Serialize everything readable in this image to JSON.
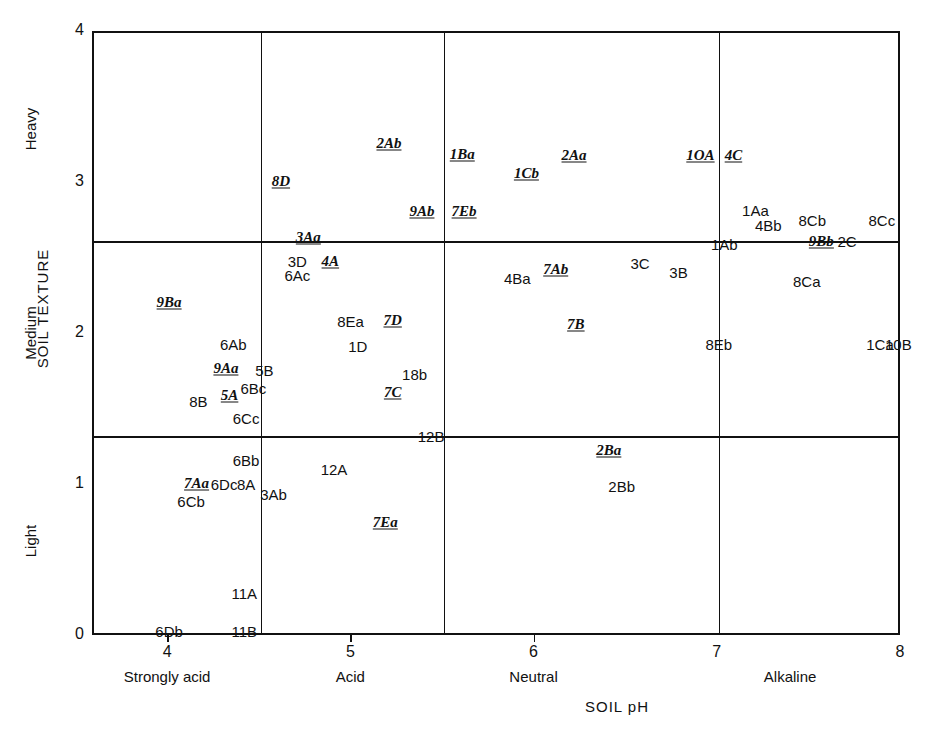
{
  "chart_data": {
    "type": "scatter",
    "title": "",
    "xlabel": "SOIL pH",
    "ylabel": "SOIL TEXTURE",
    "xlim": [
      3.59,
      8.0
    ],
    "ylim": [
      0,
      4
    ],
    "grid": true,
    "x_ticks": [
      4,
      5,
      6,
      7,
      8
    ],
    "x_tick_labels": [
      "4",
      "5",
      "6",
      "7",
      "8"
    ],
    "y_ticks": [
      0,
      1,
      2,
      3,
      4
    ],
    "y_tick_labels": [
      "0",
      "1",
      "2",
      "3",
      "4"
    ],
    "x_categories": [
      {
        "label": "Strongly acid",
        "center": 4.0
      },
      {
        "label": "Acid",
        "center": 5.0
      },
      {
        "label": "Neutral",
        "center": 6.0
      },
      {
        "label": "Alkaline",
        "center": 7.4
      }
    ],
    "y_categories": [
      {
        "label": "Light",
        "center": 0.62
      },
      {
        "label": "Medium",
        "center": 2.0
      },
      {
        "label": "Heavy",
        "center": 3.35
      }
    ],
    "x_dividers": [
      4.5,
      5.5,
      7.0
    ],
    "y_dividers": [
      1.33,
      2.62
    ],
    "points": [
      {
        "label": "8D",
        "x": 4.61,
        "y": 3.02,
        "style": "italic"
      },
      {
        "label": "2Ab",
        "x": 5.2,
        "y": 3.27,
        "style": "italic"
      },
      {
        "label": "1Ba",
        "x": 5.6,
        "y": 3.2,
        "style": "italic"
      },
      {
        "label": "1Cb",
        "x": 5.95,
        "y": 3.07,
        "style": "italic"
      },
      {
        "label": "2Aa",
        "x": 6.21,
        "y": 3.19,
        "style": "italic"
      },
      {
        "label": "1OA",
        "x": 6.9,
        "y": 3.19,
        "style": "italic"
      },
      {
        "label": "4C",
        "x": 7.08,
        "y": 3.19,
        "style": "italic"
      },
      {
        "label": "9Ab",
        "x": 5.38,
        "y": 2.82,
        "style": "italic"
      },
      {
        "label": "7Eb",
        "x": 5.61,
        "y": 2.82,
        "style": "italic"
      },
      {
        "label": "1Aa",
        "x": 7.2,
        "y": 2.83,
        "style": "plain"
      },
      {
        "label": "4Bb",
        "x": 7.27,
        "y": 2.73,
        "style": "plain"
      },
      {
        "label": "8Cb",
        "x": 7.51,
        "y": 2.76,
        "style": "plain"
      },
      {
        "label": "8Cc",
        "x": 7.89,
        "y": 2.76,
        "style": "plain"
      },
      {
        "label": "3Aa",
        "x": 4.76,
        "y": 2.65,
        "style": "italic"
      },
      {
        "label": "1Ab",
        "x": 7.03,
        "y": 2.6,
        "style": "plain"
      },
      {
        "label": "9Bb",
        "x": 7.56,
        "y": 2.62,
        "style": "italic"
      },
      {
        "label": "2C",
        "x": 7.7,
        "y": 2.62,
        "style": "plain"
      },
      {
        "label": "3D",
        "x": 4.7,
        "y": 2.49,
        "style": "plain"
      },
      {
        "label": "4A",
        "x": 4.88,
        "y": 2.49,
        "style": "italic"
      },
      {
        "label": "6Ac",
        "x": 4.7,
        "y": 2.4,
        "style": "plain"
      },
      {
        "label": "3C",
        "x": 6.57,
        "y": 2.48,
        "style": "plain"
      },
      {
        "label": "3B",
        "x": 6.78,
        "y": 2.42,
        "style": "plain"
      },
      {
        "label": "4Ba",
        "x": 5.9,
        "y": 2.38,
        "style": "plain"
      },
      {
        "label": "7Ab",
        "x": 6.11,
        "y": 2.44,
        "style": "italic"
      },
      {
        "label": "8Ca",
        "x": 7.48,
        "y": 2.36,
        "style": "plain"
      },
      {
        "label": "9Ba",
        "x": 4.0,
        "y": 2.22,
        "style": "italic"
      },
      {
        "label": "8Ea",
        "x": 4.99,
        "y": 2.09,
        "style": "plain"
      },
      {
        "label": "7D",
        "x": 5.22,
        "y": 2.1,
        "style": "italic"
      },
      {
        "label": "7B",
        "x": 6.22,
        "y": 2.07,
        "style": "italic"
      },
      {
        "label": "6Ab",
        "x": 4.35,
        "y": 1.94,
        "style": "plain"
      },
      {
        "label": "1D",
        "x": 5.03,
        "y": 1.93,
        "style": "plain"
      },
      {
        "label": "8Eb",
        "x": 7.0,
        "y": 1.94,
        "style": "plain"
      },
      {
        "label": "1Ca",
        "x": 7.88,
        "y": 1.94,
        "style": "plain"
      },
      {
        "label": "10B",
        "x": 7.98,
        "y": 1.94,
        "style": "plain"
      },
      {
        "label": "9Aa",
        "x": 4.31,
        "y": 1.78,
        "style": "italic"
      },
      {
        "label": "5B",
        "x": 4.52,
        "y": 1.77,
        "style": "plain"
      },
      {
        "label": "18b",
        "x": 5.34,
        "y": 1.74,
        "style": "plain"
      },
      {
        "label": "6Bc",
        "x": 4.46,
        "y": 1.65,
        "style": "plain"
      },
      {
        "label": "7C",
        "x": 5.22,
        "y": 1.62,
        "style": "italic"
      },
      {
        "label": "5A",
        "x": 4.33,
        "y": 1.6,
        "style": "italic"
      },
      {
        "label": "8B",
        "x": 4.16,
        "y": 1.56,
        "style": "plain"
      },
      {
        "label": "6Cc",
        "x": 4.42,
        "y": 1.45,
        "style": "plain"
      },
      {
        "label": "12B",
        "x": 5.43,
        "y": 1.33,
        "style": "plain"
      },
      {
        "label": "2Ba",
        "x": 6.4,
        "y": 1.24,
        "style": "italic"
      },
      {
        "label": "6Bb",
        "x": 4.42,
        "y": 1.17,
        "style": "plain"
      },
      {
        "label": "12A",
        "x": 4.9,
        "y": 1.11,
        "style": "plain"
      },
      {
        "label": "7Aa",
        "x": 4.15,
        "y": 1.02,
        "style": "italic"
      },
      {
        "label": "6Dc",
        "x": 4.3,
        "y": 1.01,
        "style": "plain"
      },
      {
        "label": "8A",
        "x": 4.42,
        "y": 1.01,
        "style": "plain"
      },
      {
        "label": "3Ab",
        "x": 4.57,
        "y": 0.95,
        "style": "plain"
      },
      {
        "label": "2Bb",
        "x": 6.47,
        "y": 1.0,
        "style": "plain"
      },
      {
        "label": "6Cb",
        "x": 4.12,
        "y": 0.9,
        "style": "plain"
      },
      {
        "label": "7Ea",
        "x": 5.18,
        "y": 0.76,
        "style": "italic"
      },
      {
        "label": "11A",
        "x": 4.41,
        "y": 0.29,
        "style": "plain"
      },
      {
        "label": "6Db",
        "x": 4.0,
        "y": 0.04,
        "style": "plain"
      },
      {
        "label": "11B",
        "x": 4.41,
        "y": 0.04,
        "style": "plain"
      }
    ]
  }
}
